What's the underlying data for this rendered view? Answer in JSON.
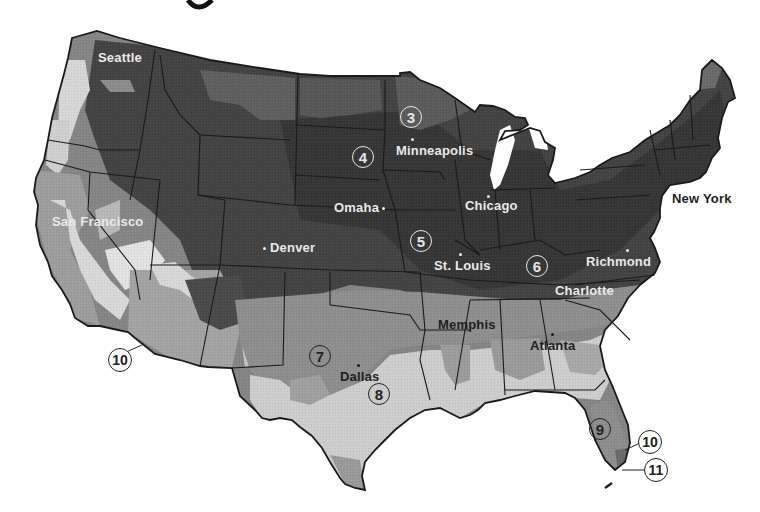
{
  "map": {
    "type": "plant-hardiness-zone-map",
    "region": "Contiguous United States",
    "title_partial": "g",
    "shade_colors": {
      "zone_3": "#4a4a4a",
      "zone_4_5_6": "#3c3c3c",
      "zone_7": "#8a8a8a",
      "zone_8": "#c9c9c9",
      "zone_9": "#8f8f8f",
      "zone_10": "#6e6e6e",
      "light_coast": "#dcdcdc",
      "water": "#ffffff",
      "borders": "#1a1a1a"
    },
    "cities": [
      {
        "name": "Seattle",
        "style": "light"
      },
      {
        "name": "San Francisco",
        "style": "light"
      },
      {
        "name": "Denver",
        "style": "light"
      },
      {
        "name": "Omaha",
        "style": "light"
      },
      {
        "name": "Minneapolis",
        "style": "light"
      },
      {
        "name": "Chicago",
        "style": "light"
      },
      {
        "name": "St. Louis",
        "style": "light"
      },
      {
        "name": "New York",
        "style": "dark"
      },
      {
        "name": "Richmond",
        "style": "light"
      },
      {
        "name": "Charlotte",
        "style": "light"
      },
      {
        "name": "Memphis",
        "style": "dark"
      },
      {
        "name": "Atlanta",
        "style": "dark"
      },
      {
        "name": "Dallas",
        "style": "dark"
      }
    ],
    "zone_labels": [
      {
        "zone": "3"
      },
      {
        "zone": "4"
      },
      {
        "zone": "5"
      },
      {
        "zone": "6"
      },
      {
        "zone": "7"
      },
      {
        "zone": "8"
      },
      {
        "zone": "9"
      },
      {
        "zone": "10",
        "location": "Southern Arizona"
      },
      {
        "zone": "10",
        "location": "South Florida"
      },
      {
        "zone": "11",
        "location": "Florida Keys"
      }
    ]
  }
}
